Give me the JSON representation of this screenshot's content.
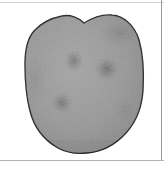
{
  "viewer": {
    "width": 164,
    "height": 170,
    "background_color": "#ffffff"
  },
  "frame": {
    "top_rule_color": "#d2d2d2",
    "bottom_rule_color": "#b4b4b4",
    "right_rule_color": "#9a9a9a"
  },
  "scan": {
    "label": "grayscale-scan-region",
    "outline_color": "#2b2b2b",
    "outline_width": 1.4,
    "fill_light": "#9d9d9d",
    "fill_mid": "#8e8e8e",
    "fill_dark": "#6f6f6f",
    "shape_description": "rounded bilobed mass with a central notch at the top and a smoothly rounded base",
    "bounds": {
      "left": 25,
      "right": 143,
      "top": 14,
      "bottom": 153
    },
    "notch": {
      "center_x": 84,
      "depth_y": 23,
      "left_peak_x": 62,
      "left_peak_y": 16,
      "right_peak_x": 110,
      "right_peak_y": 15
    },
    "lesions": [
      {
        "name": "lesion-upper-left",
        "cx": 74,
        "cy": 61,
        "rx": 10,
        "ry": 12,
        "intensity": 0.36
      },
      {
        "name": "lesion-upper-right",
        "cx": 107,
        "cy": 69,
        "rx": 13,
        "ry": 13,
        "intensity": 0.42
      },
      {
        "name": "lesion-lower-left",
        "cx": 62,
        "cy": 103,
        "rx": 11,
        "ry": 11,
        "intensity": 0.4
      },
      {
        "name": "shading-top-right",
        "cx": 120,
        "cy": 33,
        "rx": 22,
        "ry": 16,
        "intensity": 0.28
      },
      {
        "name": "shading-lower-right",
        "cx": 126,
        "cy": 110,
        "rx": 16,
        "ry": 18,
        "intensity": 0.2
      },
      {
        "name": "shading-left-edge",
        "cx": 35,
        "cy": 80,
        "rx": 14,
        "ry": 30,
        "intensity": 0.16
      }
    ]
  }
}
